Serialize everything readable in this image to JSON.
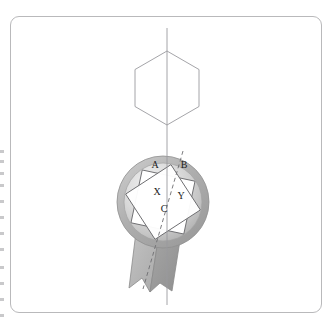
{
  "figure": {
    "background_color": "#ffffff",
    "frame": {
      "border_color": "#b9b9bb",
      "corner_radius": 9,
      "x": 10,
      "y": 16,
      "width": 312,
      "height": 297
    },
    "axis_line": {
      "label": "vertical-axis",
      "color": "#9a9a9e",
      "x": 167,
      "y_top": 28,
      "y_bottom": 305,
      "style": "solid"
    },
    "dashed_line": {
      "label": "dashed-cut-line",
      "color": "#6d6d70",
      "x1": 183,
      "y1": 151,
      "x2": 143,
      "y2": 289,
      "style": "dashed"
    },
    "hexagon": {
      "label": "hexagon",
      "stroke": "#9a9a9e",
      "fill": "#ffffff",
      "center_x": 167,
      "center_y": 88,
      "radius": 37,
      "orientation": "pointy-top"
    },
    "badge": {
      "label": "rosette-badge",
      "circle": {
        "center_x": 163,
        "center_y": 202,
        "radius": 46,
        "rim_color": "#a8a8a8",
        "face_color": "#d6d6d6",
        "highlight_color": "#efefef"
      },
      "star": {
        "points": 8,
        "fill": "#ffffff",
        "stroke": "#6d6d70",
        "inner_square_fill": "#ffffff"
      },
      "ribbon": {
        "left_tail_color": "#b5b5b5",
        "right_tail_color": "#9d9d9d",
        "stroke": "#8a8a8a"
      }
    },
    "labels": [
      {
        "id": "A",
        "text": "A",
        "x": 155,
        "y": 165
      },
      {
        "id": "B",
        "text": "B",
        "x": 184,
        "y": 165
      },
      {
        "id": "X",
        "text": "X",
        "x": 157,
        "y": 192
      },
      {
        "id": "Y",
        "text": "Y",
        "x": 180,
        "y": 196
      },
      {
        "id": "C",
        "text": "C",
        "x": 164,
        "y": 209
      }
    ],
    "edge_artifacts": {
      "label": "scan-edge-artifacts",
      "color": "#c9c9cb",
      "offsets": [
        2,
        12,
        24,
        36,
        52,
        68,
        84,
        100,
        118,
        134,
        150,
        166
      ]
    }
  }
}
